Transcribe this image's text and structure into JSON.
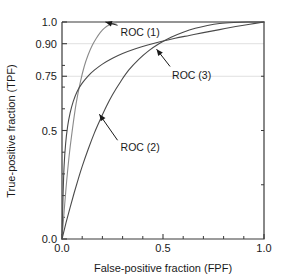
{
  "chart_data": {
    "type": "line",
    "title": "",
    "xlabel": "False-positive fraction (FPF)",
    "ylabel": "True-positive fraction (TPF)",
    "xlim": [
      0.0,
      1.0
    ],
    "ylim": [
      0.0,
      1.0
    ],
    "xticks": [
      0.0,
      0.5,
      1.0
    ],
    "xticklabels": [
      "0.0",
      "0.5",
      "1.0"
    ],
    "x_minor_ticks": [
      0.1,
      0.2,
      0.3,
      0.4,
      0.6,
      0.7,
      0.8,
      0.9
    ],
    "yticks": [
      0.0,
      0.5,
      0.75,
      0.9,
      1.0
    ],
    "yticklabels": [
      "0.0",
      "0.5",
      "0.75",
      "0.90",
      "1.0"
    ],
    "y_minor_ticks": [
      0.1,
      0.2,
      0.3,
      0.4,
      0.6,
      0.7,
      0.8
    ],
    "gridlines": [
      0.75,
      0.9
    ],
    "grid": "horizontal-faint",
    "legend_position": "inline-annotations",
    "series": [
      {
        "name": "ROC (1)",
        "color": "#8a8a8a",
        "label_x": 0.29,
        "label_y": 0.955,
        "arrow_from_x": 0.275,
        "arrow_from_y": 0.985,
        "arrow_to_x": 0.215,
        "arrow_to_y": 1.0,
        "points": [
          [
            0.0,
            0.0
          ],
          [
            0.01,
            0.12
          ],
          [
            0.02,
            0.235
          ],
          [
            0.035,
            0.38
          ],
          [
            0.05,
            0.495
          ],
          [
            0.07,
            0.625
          ],
          [
            0.09,
            0.72
          ],
          [
            0.11,
            0.795
          ],
          [
            0.13,
            0.85
          ],
          [
            0.15,
            0.893
          ],
          [
            0.17,
            0.925
          ],
          [
            0.19,
            0.952
          ],
          [
            0.21,
            0.972
          ],
          [
            0.235,
            0.987
          ],
          [
            0.26,
            0.995
          ],
          [
            0.29,
            0.999
          ],
          [
            0.33,
            1.0
          ],
          [
            1.0,
            1.0
          ]
        ]
      },
      {
        "name": "ROC (2)",
        "color": "#4a4a4a",
        "label_x": 0.29,
        "label_y": 0.425,
        "arrow_from_x": 0.275,
        "arrow_from_y": 0.455,
        "arrow_to_x": 0.185,
        "arrow_to_y": 0.575,
        "points": [
          [
            0.0,
            0.0
          ],
          [
            0.02,
            0.075
          ],
          [
            0.04,
            0.145
          ],
          [
            0.06,
            0.212
          ],
          [
            0.08,
            0.275
          ],
          [
            0.1,
            0.335
          ],
          [
            0.13,
            0.415
          ],
          [
            0.16,
            0.488
          ],
          [
            0.19,
            0.552
          ],
          [
            0.22,
            0.612
          ],
          [
            0.25,
            0.665
          ],
          [
            0.29,
            0.725
          ],
          [
            0.33,
            0.778
          ],
          [
            0.38,
            0.828
          ],
          [
            0.43,
            0.868
          ],
          [
            0.48,
            0.9
          ],
          [
            0.54,
            0.93
          ],
          [
            0.6,
            0.953
          ],
          [
            0.66,
            0.971
          ],
          [
            0.72,
            0.984
          ],
          [
            0.78,
            0.993
          ],
          [
            0.85,
            0.998
          ],
          [
            0.92,
            1.0
          ],
          [
            1.0,
            1.0
          ]
        ]
      },
      {
        "name": "ROC (3)",
        "color": "#4a4a4a",
        "label_x": 0.545,
        "label_y": 0.755,
        "arrow_from_x": 0.535,
        "arrow_from_y": 0.795,
        "arrow_to_x": 0.468,
        "arrow_to_y": 0.875,
        "points": [
          [
            0.0,
            0.0
          ],
          [
            0.005,
            0.19
          ],
          [
            0.01,
            0.33
          ],
          [
            0.018,
            0.44
          ],
          [
            0.028,
            0.52
          ],
          [
            0.04,
            0.58
          ],
          [
            0.055,
            0.632
          ],
          [
            0.075,
            0.68
          ],
          [
            0.1,
            0.718
          ],
          [
            0.13,
            0.752
          ],
          [
            0.16,
            0.778
          ],
          [
            0.2,
            0.806
          ],
          [
            0.25,
            0.833
          ],
          [
            0.3,
            0.855
          ],
          [
            0.36,
            0.876
          ],
          [
            0.42,
            0.893
          ],
          [
            0.49,
            0.91
          ],
          [
            0.56,
            0.925
          ],
          [
            0.63,
            0.938
          ],
          [
            0.7,
            0.951
          ],
          [
            0.78,
            0.965
          ],
          [
            0.86,
            0.979
          ],
          [
            0.93,
            0.99
          ],
          [
            1.0,
            1.0
          ]
        ]
      }
    ]
  },
  "axes": {
    "x_title": "False-positive fraction (FPF)",
    "y_title": "True-positive fraction (TPF)"
  },
  "colors": {
    "axis": "#3a3a3a",
    "grid": "#e0e0e0",
    "text": "#1a1a1a",
    "curve_light": "#8a8a8a",
    "curve_dark": "#4a4a4a",
    "background": "#ffffff"
  }
}
